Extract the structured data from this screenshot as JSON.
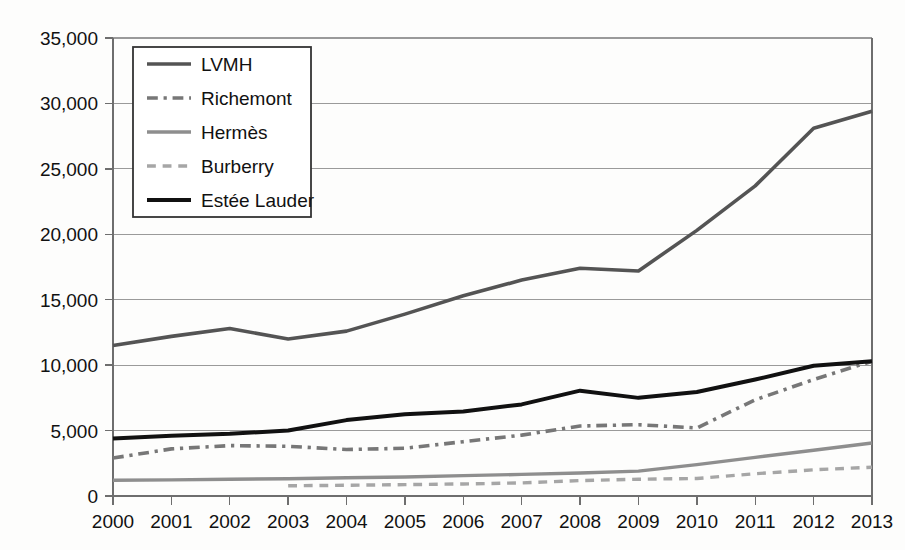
{
  "chart_data": {
    "type": "line",
    "title": "",
    "subtitle": "",
    "xlabel": "",
    "ylabel": "",
    "x": [
      2000,
      2001,
      2002,
      2003,
      2004,
      2005,
      2006,
      2007,
      2008,
      2009,
      2010,
      2011,
      2012,
      2013
    ],
    "categories": [
      "2000",
      "2001",
      "2002",
      "2003",
      "2004",
      "2005",
      "2006",
      "2007",
      "2008",
      "2009",
      "2010",
      "2011",
      "2012",
      "2013"
    ],
    "xlim": [
      2000,
      2013
    ],
    "ylim": [
      0,
      35000
    ],
    "ytick_values": [
      0,
      5000,
      10000,
      15000,
      20000,
      25000,
      30000,
      35000
    ],
    "ytick_labels": [
      "0",
      "5,000",
      "10,000",
      "15,000",
      "20,000",
      "25,000",
      "30,000",
      "35,000"
    ],
    "grid": true,
    "grid_axis": "y",
    "legend_position": "top-left",
    "series": [
      {
        "name": "LVMH",
        "color": "#545454",
        "style": "solid",
        "width": 3.6,
        "x": [
          2000,
          2001,
          2002,
          2003,
          2004,
          2005,
          2006,
          2007,
          2008,
          2009,
          2010,
          2011,
          2012,
          2013
        ],
        "values": [
          11500,
          12200,
          12800,
          12000,
          12600,
          13900,
          15300,
          16500,
          17400,
          17200,
          20300,
          23700,
          28100,
          29400
        ]
      },
      {
        "name": "Richemont",
        "color": "#777777",
        "style": "dashdot",
        "width": 3.6,
        "x": [
          2000,
          2001,
          2002,
          2003,
          2004,
          2005,
          2006,
          2007,
          2008,
          2009,
          2010,
          2011,
          2012,
          2013
        ],
        "values": [
          2900,
          3600,
          3850,
          3800,
          3550,
          3650,
          4150,
          4650,
          5350,
          5450,
          5200,
          7350,
          8900,
          10300
        ]
      },
      {
        "name": "Hermès",
        "color": "#8e8e8e",
        "style": "solid",
        "width": 3.4,
        "x": [
          2000,
          2001,
          2002,
          2003,
          2004,
          2005,
          2006,
          2007,
          2008,
          2009,
          2010,
          2011,
          2012,
          2013
        ],
        "values": [
          1200,
          1230,
          1280,
          1320,
          1400,
          1450,
          1560,
          1650,
          1760,
          1900,
          2400,
          2950,
          3500,
          4050
        ]
      },
      {
        "name": "Burberry",
        "color": "#a6a6a6",
        "style": "dashed",
        "width": 3.4,
        "x": [
          2003,
          2004,
          2005,
          2006,
          2007,
          2008,
          2009,
          2010,
          2011,
          2012,
          2013
        ],
        "values": [
          780,
          820,
          870,
          920,
          1000,
          1180,
          1280,
          1340,
          1700,
          2000,
          2200
        ]
      },
      {
        "name": "Estée Lauder",
        "color": "#111111",
        "style": "solid",
        "width": 4.0,
        "x": [
          2000,
          2001,
          2002,
          2003,
          2004,
          2005,
          2006,
          2007,
          2008,
          2009,
          2010,
          2011,
          2012,
          2013
        ],
        "values": [
          4400,
          4600,
          4750,
          5000,
          5800,
          6250,
          6450,
          7000,
          8050,
          7500,
          7950,
          8900,
          9950,
          10300
        ]
      }
    ]
  },
  "legend": {
    "entries": [
      {
        "label": "LVMH"
      },
      {
        "label": "Richemont"
      },
      {
        "label": "Hermès"
      },
      {
        "label": "Burberry"
      },
      {
        "label": "Estée Lauder"
      }
    ]
  },
  "colors": {
    "background": "#fdfdfc",
    "gridline": "#9a9a9a",
    "axis": "#6e6e6e",
    "text": "#111111",
    "legend_border": "#333333"
  }
}
